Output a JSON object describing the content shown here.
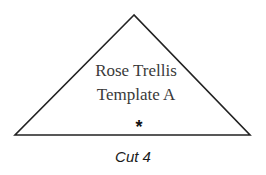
{
  "template": {
    "shape": "triangle",
    "title_line1": "Rose Trellis",
    "title_line2": "Template A",
    "grain_mark": "*",
    "cut_label": "Cut 4",
    "stroke_color": "#222222"
  }
}
